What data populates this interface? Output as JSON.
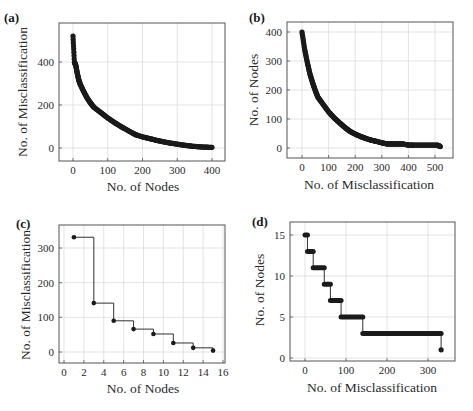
{
  "chart_data": [
    {
      "panel": "(a)",
      "type": "scatter",
      "title": "",
      "xlabel": "No. of Nodes",
      "ylabel": "No. of Misclassification",
      "xticks": [
        "0",
        "100",
        "200",
        "300",
        "400"
      ],
      "yticks": [
        "0",
        "200",
        "400"
      ],
      "xlim": [
        -40,
        440
      ],
      "ylim": [
        -30,
        580
      ],
      "grid": true,
      "x": [
        0,
        4,
        8,
        12,
        16,
        20,
        30,
        40,
        50,
        60,
        80,
        100,
        120,
        140,
        160,
        180,
        200,
        220,
        240,
        260,
        280,
        300,
        320,
        340,
        360,
        380,
        400
      ],
      "y": [
        520,
        400,
        385,
        350,
        320,
        300,
        265,
        235,
        210,
        190,
        165,
        140,
        118,
        98,
        80,
        62,
        52,
        44,
        36,
        29,
        23,
        18,
        13,
        9,
        6,
        4,
        3
      ]
    },
    {
      "panel": "(b)",
      "type": "scatter",
      "title": "",
      "xlabel": "No. of Misclassification",
      "ylabel": "No. of Nodes",
      "xticks": [
        "0",
        "100",
        "200",
        "300",
        "400",
        "500"
      ],
      "yticks": [
        "0",
        "100",
        "200",
        "300",
        "400"
      ],
      "xlim": [
        -40,
        560
      ],
      "ylim": [
        -30,
        435
      ],
      "grid": true,
      "x": [
        0,
        10,
        20,
        30,
        40,
        50,
        60,
        80,
        100,
        120,
        140,
        160,
        180,
        200,
        220,
        240,
        260,
        280,
        300,
        320,
        340,
        360,
        380,
        400,
        420,
        450,
        480,
        510,
        520
      ],
      "y": [
        400,
        340,
        295,
        255,
        225,
        198,
        175,
        150,
        125,
        105,
        88,
        72,
        58,
        48,
        40,
        33,
        27,
        23,
        18,
        14,
        14,
        14,
        14,
        10,
        10,
        10,
        10,
        10,
        5
      ]
    },
    {
      "panel": "(c)",
      "type": "line",
      "step": "post",
      "title": "",
      "xlabel": "No. of Nodes",
      "ylabel": "No. of Misclassification",
      "xticks": [
        "0",
        "2",
        "4",
        "6",
        "8",
        "10",
        "12",
        "14",
        "16"
      ],
      "yticks": [
        "0",
        "100",
        "200",
        "300"
      ],
      "xlim": [
        -0.5,
        16.2
      ],
      "ylim": [
        -30,
        370
      ],
      "grid": true,
      "x": [
        1,
        3,
        5,
        7,
        9,
        11,
        13,
        15
      ],
      "y": [
        331,
        141,
        90,
        66,
        52,
        26,
        12,
        4
      ]
    },
    {
      "panel": "(d)",
      "type": "scatter",
      "step": "post",
      "title": "",
      "xlabel": "No. of Misclassification",
      "ylabel": "No. of Nodes",
      "xticks": [
        "0",
        "100",
        "200",
        "300"
      ],
      "yticks": [
        "0",
        "5",
        "10",
        "15"
      ],
      "xlim": [
        -35,
        365
      ],
      "ylim": [
        -0.4,
        16.5
      ],
      "grid": true,
      "segments": [
        {
          "y": 15,
          "x_start": 0,
          "x_end": 6
        },
        {
          "y": 13,
          "x_start": 6,
          "x_end": 20
        },
        {
          "y": 11,
          "x_start": 20,
          "x_end": 47
        },
        {
          "y": 9,
          "x_start": 47,
          "x_end": 62
        },
        {
          "y": 7,
          "x_start": 62,
          "x_end": 88
        },
        {
          "y": 5,
          "x_start": 88,
          "x_end": 141
        },
        {
          "y": 3,
          "x_start": 141,
          "x_end": 332
        },
        {
          "y": 1,
          "x_start": 332,
          "x_end": 332
        }
      ]
    }
  ],
  "labels": {
    "a": "(a)",
    "b": "(b)",
    "c": "(c)",
    "d": "(d)",
    "a_x": "No.  of Nodes",
    "a_y": "No.  of Misclassification",
    "b_x": "No.  of Misclassification",
    "b_y": "No. of Nodes",
    "c_x": "No.  of Nodes",
    "c_y": "No.  of Misclassification",
    "d_x": "No.  of Misclassification",
    "d_y": "No.  of Nodes"
  },
  "colors": {
    "data": "#1a1a1a",
    "grid": "#dcdcdc",
    "frame": "#555555"
  }
}
